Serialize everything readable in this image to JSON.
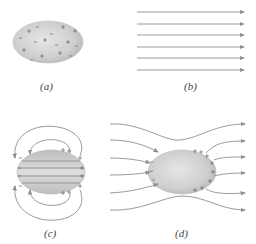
{
  "panels": {
    "a": {
      "label": "(a)",
      "description": "Conductor with charges randomly distributed"
    },
    "b": {
      "label": "(b)",
      "description": "Uniform external electric field"
    },
    "c": {
      "label": "(c)",
      "description": "Induced charges create opposing field inside conductor"
    },
    "d": {
      "label": "(d)",
      "description": "Net field: zero inside, perpendicular at surface"
    }
  },
  "symbols": {
    "plus": "+",
    "minus": "−"
  },
  "colors": {
    "body": "#c9c9c9",
    "line": "#8e8e8e",
    "charge": "#6a6a6a"
  }
}
